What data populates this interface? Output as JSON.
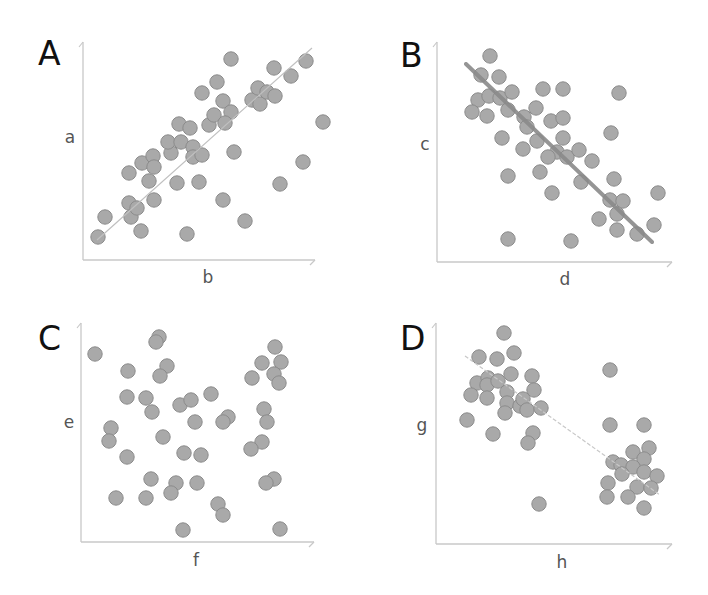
{
  "figure": {
    "width": 708,
    "height": 595,
    "background": "#ffffff",
    "dot_fill": "#a9a9a9",
    "dot_stroke": "#8c8c8c",
    "axis_color": "#c8c8c8",
    "panel_label_color": "#111111",
    "axis_label_color": "#555555"
  },
  "chart_data": [
    {
      "type": "scatter",
      "panel_label": "A",
      "xlabel": "b",
      "ylabel": "a",
      "description": "Strong positive correlation with regression line",
      "regression_line": {
        "from": [
          97,
          240
        ],
        "to": [
          312,
          48
        ],
        "style": "thin",
        "color": "#c0c0c0"
      },
      "axis": {
        "x0": 83,
        "y0": 260,
        "x1": 315,
        "y1": 42
      },
      "label_pos": {
        "panel": [
          38,
          65
        ],
        "xlabel": [
          208,
          283
        ],
        "ylabel": [
          70,
          143
        ]
      },
      "points_px": [
        [
          98,
          237
        ],
        [
          105,
          217
        ],
        [
          129,
          203
        ],
        [
          131,
          217
        ],
        [
          137,
          208
        ],
        [
          141,
          231
        ],
        [
          129,
          173
        ],
        [
          142,
          163
        ],
        [
          153,
          156
        ],
        [
          154,
          167
        ],
        [
          149,
          181
        ],
        [
          154,
          200
        ],
        [
          177,
          183
        ],
        [
          187,
          234
        ],
        [
          171,
          153
        ],
        [
          168,
          142
        ],
        [
          181,
          142
        ],
        [
          179,
          124
        ],
        [
          190,
          128
        ],
        [
          193,
          147
        ],
        [
          193,
          157
        ],
        [
          202,
          155
        ],
        [
          199,
          182
        ],
        [
          202,
          93
        ],
        [
          217,
          82
        ],
        [
          231,
          59
        ],
        [
          209,
          125
        ],
        [
          214,
          115
        ],
        [
          223,
          101
        ],
        [
          231,
          112
        ],
        [
          225,
          123
        ],
        [
          234,
          152
        ],
        [
          223,
          200
        ],
        [
          245,
          221
        ],
        [
          252,
          100
        ],
        [
          258,
          88
        ],
        [
          260,
          104
        ],
        [
          267,
          92
        ],
        [
          274,
          68
        ],
        [
          275,
          96
        ],
        [
          291,
          76
        ],
        [
          306,
          61
        ],
        [
          323,
          122
        ],
        [
          303,
          162
        ],
        [
          280,
          184
        ]
      ]
    },
    {
      "type": "scatter",
      "panel_label": "B",
      "xlabel": "d",
      "ylabel": "c",
      "description": "Strong negative correlation with thick regression line",
      "regression_line": {
        "from": [
          466,
          64
        ],
        "to": [
          652,
          242
        ],
        "style": "thick",
        "color": "#8a8a8a"
      },
      "axis": {
        "x0": 437,
        "y0": 262,
        "x1": 672,
        "y1": 42
      },
      "label_pos": {
        "panel": [
          400,
          67
        ],
        "xlabel": [
          565,
          285
        ],
        "ylabel": [
          425,
          150
        ]
      },
      "points_px": [
        [
          490,
          56
        ],
        [
          481,
          75
        ],
        [
          499,
          77
        ],
        [
          478,
          100
        ],
        [
          489,
          96
        ],
        [
          500,
          98
        ],
        [
          512,
          92
        ],
        [
          472,
          112
        ],
        [
          487,
          116
        ],
        [
          508,
          110
        ],
        [
          524,
          117
        ],
        [
          536,
          108
        ],
        [
          527,
          127
        ],
        [
          502,
          138
        ],
        [
          523,
          149
        ],
        [
          537,
          141
        ],
        [
          543,
          89
        ],
        [
          563,
          89
        ],
        [
          551,
          121
        ],
        [
          563,
          118
        ],
        [
          563,
          138
        ],
        [
          557,
          152
        ],
        [
          548,
          157
        ],
        [
          567,
          157
        ],
        [
          579,
          150
        ],
        [
          592,
          161
        ],
        [
          540,
          172
        ],
        [
          508,
          176
        ],
        [
          552,
          193
        ],
        [
          581,
          182
        ],
        [
          619,
          93
        ],
        [
          611,
          133
        ],
        [
          614,
          179
        ],
        [
          610,
          200
        ],
        [
          623,
          201
        ],
        [
          617,
          214
        ],
        [
          599,
          219
        ],
        [
          617,
          230
        ],
        [
          637,
          234
        ],
        [
          654,
          225
        ],
        [
          658,
          193
        ],
        [
          508,
          239
        ],
        [
          571,
          241
        ]
      ]
    },
    {
      "type": "scatter",
      "panel_label": "C",
      "xlabel": "f",
      "ylabel": "e",
      "description": "No correlation (random scatter)",
      "regression_line": null,
      "axis": {
        "x0": 81,
        "y0": 542,
        "x1": 314,
        "y1": 323
      },
      "label_pos": {
        "panel": [
          38,
          350
        ],
        "xlabel": [
          196,
          566
        ],
        "ylabel": [
          69,
          428
        ]
      },
      "points_px": [
        [
          95,
          354
        ],
        [
          159,
          337
        ],
        [
          156,
          342
        ],
        [
          128,
          371
        ],
        [
          167,
          366
        ],
        [
          160,
          376
        ],
        [
          127,
          397
        ],
        [
          146,
          398
        ],
        [
          152,
          412
        ],
        [
          180,
          405
        ],
        [
          191,
          400
        ],
        [
          211,
          394
        ],
        [
          195,
          422
        ],
        [
          228,
          417
        ],
        [
          223,
          422
        ],
        [
          111,
          428
        ],
        [
          109,
          441
        ],
        [
          163,
          437
        ],
        [
          127,
          457
        ],
        [
          184,
          453
        ],
        [
          201,
          455
        ],
        [
          151,
          479
        ],
        [
          176,
          483
        ],
        [
          171,
          493
        ],
        [
          197,
          483
        ],
        [
          116,
          498
        ],
        [
          146,
          498
        ],
        [
          218,
          504
        ],
        [
          223,
          515
        ],
        [
          183,
          530
        ],
        [
          275,
          347
        ],
        [
          262,
          363
        ],
        [
          281,
          362
        ],
        [
          274,
          374
        ],
        [
          279,
          383
        ],
        [
          252,
          378
        ],
        [
          264,
          409
        ],
        [
          267,
          422
        ],
        [
          262,
          442
        ],
        [
          251,
          449
        ],
        [
          274,
          479
        ],
        [
          266,
          483
        ],
        [
          280,
          529
        ]
      ]
    },
    {
      "type": "scatter",
      "panel_label": "D",
      "xlabel": "h",
      "ylabel": "g",
      "description": "Two clusters producing spurious negative trend line",
      "regression_line": {
        "from": [
          465,
          356
        ],
        "to": [
          660,
          495
        ],
        "style": "dashed",
        "color": "#c8c8c8"
      },
      "axis": {
        "x0": 436,
        "y0": 544,
        "x1": 672,
        "y1": 323
      },
      "label_pos": {
        "panel": [
          400,
          350
        ],
        "xlabel": [
          562,
          568
        ],
        "ylabel": [
          422,
          431
        ]
      },
      "points_px": [
        [
          504,
          333
        ],
        [
          479,
          357
        ],
        [
          497,
          359
        ],
        [
          514,
          353
        ],
        [
          477,
          383
        ],
        [
          488,
          378
        ],
        [
          487,
          385
        ],
        [
          498,
          381
        ],
        [
          511,
          374
        ],
        [
          471,
          395
        ],
        [
          487,
          398
        ],
        [
          507,
          392
        ],
        [
          532,
          376
        ],
        [
          534,
          390
        ],
        [
          507,
          403
        ],
        [
          505,
          413
        ],
        [
          520,
          406
        ],
        [
          523,
          399
        ],
        [
          527,
          410
        ],
        [
          541,
          408
        ],
        [
          467,
          420
        ],
        [
          493,
          434
        ],
        [
          533,
          433
        ],
        [
          528,
          443
        ],
        [
          539,
          504
        ],
        [
          610,
          370
        ],
        [
          610,
          425
        ],
        [
          644,
          425
        ],
        [
          633,
          452
        ],
        [
          649,
          448
        ],
        [
          644,
          459
        ],
        [
          613,
          462
        ],
        [
          621,
          465
        ],
        [
          633,
          467
        ],
        [
          644,
          472
        ],
        [
          622,
          474
        ],
        [
          657,
          476
        ],
        [
          608,
          483
        ],
        [
          637,
          487
        ],
        [
          651,
          488
        ],
        [
          607,
          497
        ],
        [
          628,
          497
        ],
        [
          644,
          508
        ]
      ]
    }
  ]
}
